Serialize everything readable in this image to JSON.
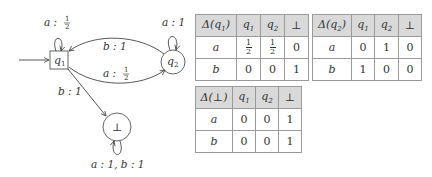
{
  "automaton": {
    "states": [
      {
        "id": "q1",
        "label": "q",
        "sub": "1",
        "shape": "box",
        "initial": true
      },
      {
        "id": "q2",
        "label": "q",
        "sub": "2",
        "shape": "circle"
      },
      {
        "id": "bot",
        "label": "⊥",
        "shape": "circle"
      }
    ],
    "transitions": [
      {
        "from": "q1",
        "to": "q1",
        "label_sym": "a :",
        "label_num": "1",
        "label_den": "2"
      },
      {
        "from": "q2",
        "to": "q1",
        "label": "b : 1"
      },
      {
        "from": "q1",
        "to": "q2",
        "label_sym": "a :",
        "label_num": "1",
        "label_den": "2"
      },
      {
        "from": "q2",
        "to": "q2",
        "label": "a : 1"
      },
      {
        "from": "q1",
        "to": "bot",
        "label": "b : 1"
      },
      {
        "from": "bot",
        "to": "bot",
        "label": "a : 1, b : 1"
      }
    ]
  },
  "tables": {
    "delta_q1": {
      "title": "Δ(q",
      "title_sub": "1",
      "title_end": ")",
      "cols": [
        "q1",
        "q2",
        "⊥"
      ],
      "rows": [
        {
          "sym": "a",
          "vals": [
            "1/2",
            "1/2",
            "0"
          ]
        },
        {
          "sym": "b",
          "vals": [
            "0",
            "0",
            "1"
          ]
        }
      ]
    },
    "delta_q2": {
      "title": "Δ(q",
      "title_sub": "2",
      "title_end": ")",
      "cols": [
        "q1",
        "q2",
        "⊥"
      ],
      "rows": [
        {
          "sym": "a",
          "vals": [
            "0",
            "1",
            "0"
          ]
        },
        {
          "sym": "b",
          "vals": [
            "1",
            "0",
            "0"
          ]
        }
      ]
    },
    "delta_bot": {
      "title": "Δ(⊥)",
      "cols": [
        "q1",
        "q2",
        "⊥"
      ],
      "rows": [
        {
          "sym": "a",
          "vals": [
            "0",
            "0",
            "1"
          ]
        },
        {
          "sym": "b",
          "vals": [
            "0",
            "0",
            "1"
          ]
        }
      ]
    }
  },
  "common": {
    "q": "q",
    "sub1": "1",
    "sub2": "2",
    "bot": "⊥",
    "half_num": "1",
    "half_den": "2"
  }
}
